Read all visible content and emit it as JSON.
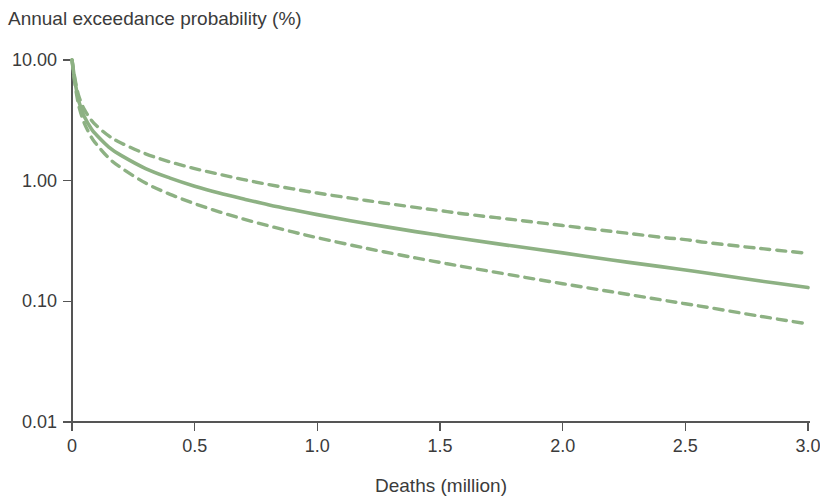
{
  "chart_data": {
    "type": "line",
    "title": "Annual exceedance probability (%)",
    "xlabel": "Deaths (million)",
    "ylabel": "Annual exceedance probability (%)",
    "yscale": "log",
    "xscale": "linear",
    "xlim": [
      0,
      3.0
    ],
    "ylim": [
      0.01,
      10.0
    ],
    "grid": false,
    "legend": false,
    "legend_position": "none",
    "x_tick_labels": [
      "0",
      "0.5",
      "1.0",
      "1.5",
      "2.0",
      "2.5",
      "3.0"
    ],
    "x_ticks": [
      0,
      0.5,
      1.0,
      1.5,
      2.0,
      2.5,
      3.0
    ],
    "y_tick_labels": [
      "10.00",
      "1.00",
      "0.10",
      "0.01"
    ],
    "y_ticks": [
      10.0,
      1.0,
      0.1,
      0.01
    ],
    "colors": {
      "series": "#8db183",
      "axis": "#555555",
      "text": "#3b3b3b",
      "background": "#ffffff"
    },
    "series": [
      {
        "name": "Upper confidence bound",
        "style": "dashed",
        "color": "#8db183",
        "x": [
          0.0,
          0.01,
          0.02,
          0.03,
          0.05,
          0.08,
          0.1,
          0.15,
          0.2,
          0.3,
          0.4,
          0.5,
          0.6,
          0.7,
          0.8,
          0.9,
          1.0,
          1.2,
          1.4,
          1.5,
          1.6,
          1.8,
          2.0,
          2.2,
          2.4,
          2.5,
          2.6,
          2.8,
          3.0
        ],
        "y": [
          10.0,
          7.4,
          5.8,
          4.85,
          3.9,
          3.15,
          2.85,
          2.35,
          2.05,
          1.67,
          1.43,
          1.26,
          1.13,
          1.02,
          0.93,
          0.855,
          0.79,
          0.685,
          0.6,
          0.565,
          0.53,
          0.475,
          0.425,
          0.38,
          0.34,
          0.325,
          0.305,
          0.275,
          0.25
        ]
      },
      {
        "name": "Central estimate",
        "style": "solid",
        "color": "#8db183",
        "x": [
          0.0,
          0.01,
          0.02,
          0.03,
          0.05,
          0.08,
          0.1,
          0.15,
          0.2,
          0.3,
          0.4,
          0.5,
          0.6,
          0.7,
          0.8,
          0.9,
          1.0,
          1.2,
          1.4,
          1.5,
          1.6,
          1.8,
          2.0,
          2.2,
          2.4,
          2.5,
          2.6,
          2.8,
          3.0
        ],
        "y": [
          10.0,
          7.1,
          5.4,
          4.4,
          3.4,
          2.67,
          2.39,
          1.9,
          1.62,
          1.26,
          1.05,
          0.9,
          0.79,
          0.705,
          0.632,
          0.573,
          0.523,
          0.442,
          0.378,
          0.352,
          0.328,
          0.287,
          0.252,
          0.22,
          0.194,
          0.182,
          0.17,
          0.148,
          0.13
        ]
      },
      {
        "name": "Lower confidence bound",
        "style": "dashed",
        "color": "#8db183",
        "x": [
          0.0,
          0.01,
          0.02,
          0.03,
          0.05,
          0.08,
          0.1,
          0.15,
          0.2,
          0.3,
          0.4,
          0.5,
          0.6,
          0.7,
          0.8,
          0.9,
          1.0,
          1.2,
          1.4,
          1.5,
          1.6,
          1.8,
          2.0,
          2.2,
          2.4,
          2.5,
          2.6,
          2.8,
          3.0
        ],
        "y": [
          10.0,
          6.8,
          5.0,
          4.0,
          3.0,
          2.27,
          2.0,
          1.54,
          1.28,
          0.955,
          0.77,
          0.645,
          0.552,
          0.48,
          0.423,
          0.376,
          0.337,
          0.275,
          0.229,
          0.21,
          0.193,
          0.164,
          0.14,
          0.12,
          0.103,
          0.0955,
          0.0885,
          0.0755,
          0.065
        ]
      }
    ]
  }
}
